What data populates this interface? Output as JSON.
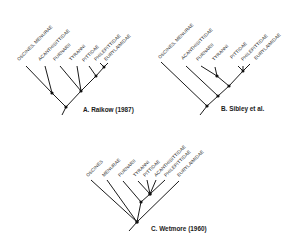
{
  "figure": {
    "panels": [
      {
        "id": "A",
        "caption": "A. Raikow (1987)",
        "taxa": [
          "OSCINES, MENURAE",
          "ACANTHISITTIDAE",
          "FURNARII",
          "TYRANNI",
          "PITTIDAE",
          "PHILEPITTIDAE",
          "EURYLAIMIDAE"
        ]
      },
      {
        "id": "B",
        "caption": "B. Sibley et al.",
        "taxa": [
          "OSCINES, MENURAE",
          "ACANTHISITTIDAE",
          "FURNARII",
          "TYRANNI",
          "PITTIDAE",
          "PHILEPITTIDAE",
          "EURYLAIMIDAE"
        ]
      },
      {
        "id": "C",
        "caption": "C. Wetmore (1960)",
        "taxa": [
          "OSCINES",
          "MENURAE",
          "FURNARII",
          "TYRANNI",
          "PITTIDAE",
          "ACANTHISITTIDAE",
          "PHILEPITTIDAE",
          "EURYLAIMIDAE"
        ]
      }
    ]
  }
}
